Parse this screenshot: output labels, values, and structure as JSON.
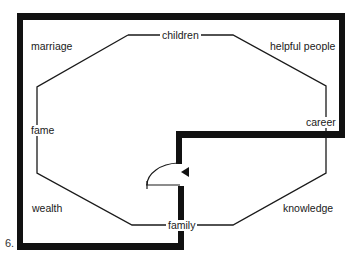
{
  "figure": {
    "number": "6.",
    "type": "bagua floor plan diagram",
    "colors": {
      "wall": "#111111",
      "line": "#1a1a1a",
      "background": "#ffffff"
    }
  },
  "areas": {
    "top_left": "marriage",
    "top": "children",
    "top_right": "helpful people",
    "left": "fame",
    "right": "career",
    "bottom_left": "wealth",
    "bottom": "family",
    "bottom_right": "knowledge"
  },
  "elements": {
    "door": "door-swing",
    "entry_arrow": "arrow-left"
  }
}
